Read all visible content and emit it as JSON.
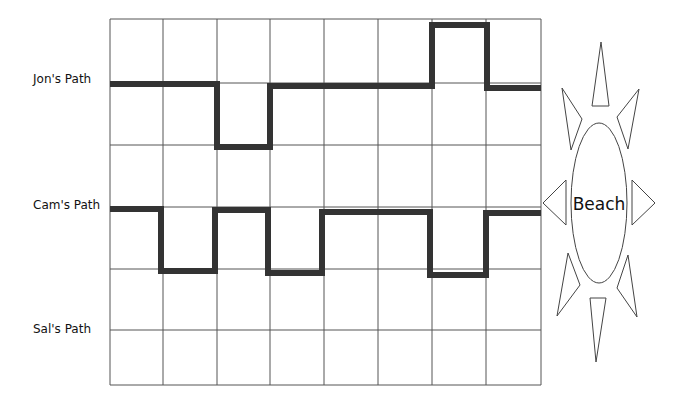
{
  "diagram": {
    "type": "grid-paths",
    "grid": {
      "columns": 8,
      "rows": 6,
      "x_lines": [
        110,
        163,
        217,
        270,
        324,
        378,
        432,
        486,
        541
      ],
      "y_lines": [
        19,
        83,
        145,
        207,
        269,
        330,
        385
      ],
      "line_color": "#555555"
    },
    "paths": [
      {
        "label": "Jon's Path",
        "label_pos": [
          33,
          80
        ],
        "color": "#333333",
        "points": "110,84 217,84 217,147 270,147 270,86 432,86 432,25 487,25 487,88 541,88"
      },
      {
        "label": "Cam's Path",
        "label_pos": [
          33,
          206
        ],
        "color": "#333333",
        "points": "110,209 161,209 161,271 215,271 215,210 268,210 268,273 322,273 322,212 430,212 430,275 486,275 486,213 541,213"
      },
      {
        "label": "Sal's Path",
        "label_pos": [
          33,
          332
        ],
        "color": "#333333",
        "points": ""
      }
    ],
    "destination": {
      "label": "Beach",
      "shape": "sun"
    }
  }
}
